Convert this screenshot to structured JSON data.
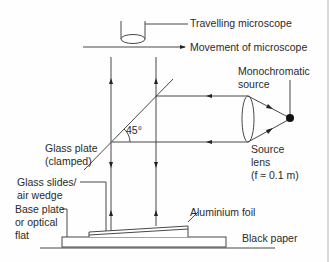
{
  "diagram": {
    "labels": {
      "travelling_microscope": "Travelling microscope",
      "movement": "Movement of microscope",
      "source_line1": "Monochromatic",
      "source_line2": "source",
      "angle": "45°",
      "glass_plate_line1": "Glass plate",
      "glass_plate_line2": "(clamped)",
      "lens_line1": "Source",
      "lens_line2": "lens",
      "lens_line3": "(f ≈ 0.1 m)",
      "slides_line1": "Glass slides/",
      "slides_line2": "air wedge",
      "base_line1": "Base plate",
      "base_line2": "or optical",
      "base_line3": "flat",
      "foil": "Aluminium foil",
      "paper": "Black paper"
    },
    "colors": {
      "line": "#333333",
      "text": "#2a2a2a",
      "source": "#111111"
    }
  }
}
